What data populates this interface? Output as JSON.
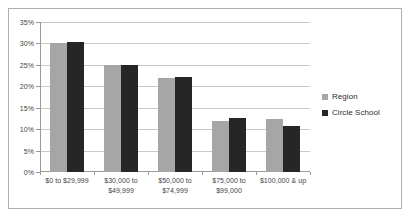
{
  "chart_data": {
    "type": "bar",
    "title": "",
    "subtitle": "",
    "xlabel": "",
    "ylabel": "",
    "ylim": [
      0,
      35
    ],
    "ytick_labels": [
      "35%",
      "30%",
      "25%",
      "20%",
      "15%",
      "10%",
      "5%",
      "0%"
    ],
    "ytick_values": [
      35,
      30,
      25,
      20,
      15,
      10,
      5,
      0
    ],
    "grid": true,
    "legend_position": "right",
    "categories": [
      [
        "$0 to $29,999"
      ],
      [
        "$30,000 to",
        "$49,999"
      ],
      [
        "$50,000 to",
        "$74,999"
      ],
      [
        "$75,000 to",
        "$99,000"
      ],
      [
        "$100,000 & up"
      ]
    ],
    "series": [
      {
        "name": "Region",
        "color": "#a6a6a6",
        "values": [
          30.0,
          25.0,
          22.0,
          12.0,
          12.3
        ]
      },
      {
        "name": "Circle School",
        "color": "#262626",
        "values": [
          30.3,
          25.0,
          22.2,
          12.7,
          10.7
        ]
      }
    ]
  },
  "legend": {
    "items": [
      {
        "label": "Region",
        "swatch": "region"
      },
      {
        "label": "Circle School",
        "swatch": "school"
      }
    ]
  }
}
